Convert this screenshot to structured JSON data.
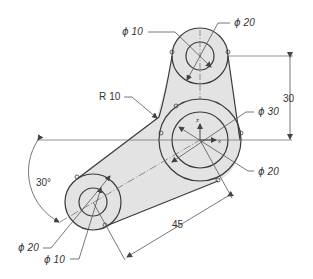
{
  "drawing": {
    "title": "Link bracket with three bosses",
    "colors": {
      "fill": "#e3e3e3",
      "outline": "#3a3a3a",
      "dimension": "#555555",
      "text": "#333333"
    },
    "dimensions": {
      "top_hole": {
        "symbol": "ϕ",
        "value": "10"
      },
      "top_boss": {
        "symbol": "ϕ",
        "value": "20"
      },
      "fillet_radius": {
        "prefix": "R",
        "value": "10"
      },
      "vertical_offset": {
        "value": "30"
      },
      "hub_outer": {
        "symbol": "ϕ",
        "value": "30"
      },
      "hub_inner": {
        "symbol": "ϕ",
        "value": "20"
      },
      "angle": {
        "value": "30°"
      },
      "arm_length": {
        "value": "45"
      },
      "bottom_boss": {
        "symbol": "ϕ",
        "value": "20"
      },
      "bottom_hole": {
        "symbol": "ϕ",
        "value": "10"
      }
    },
    "axis_labels": {
      "z": "z",
      "x": "x"
    }
  }
}
